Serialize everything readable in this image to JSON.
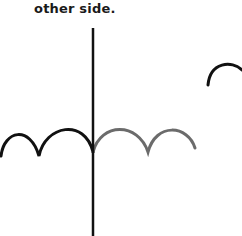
{
  "caption": "other side.",
  "colors": {
    "mirror_line": "#111111",
    "original_arcs": "#111111",
    "reflected_arcs": "#6b6b6b",
    "lone_arc": "#111111"
  }
}
